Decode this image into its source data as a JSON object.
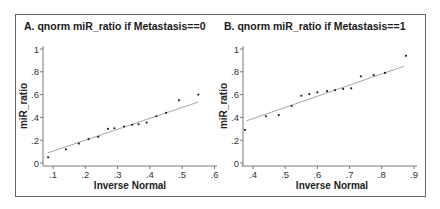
{
  "chart_data": [
    {
      "type": "scatter",
      "title": "A. qnorm miR_ratio if Metastasis==0",
      "xlabel": "Inverse Normal",
      "ylabel": "miR_ratio",
      "xlim": [
        0.08,
        0.6
      ],
      "ylim": [
        0,
        1
      ],
      "xticks": [
        ".1",
        ".2",
        ".3",
        ".4",
        ".5",
        ".6"
      ],
      "yticks": [
        "0",
        ".2",
        ".4",
        ".6",
        ".8",
        "1"
      ],
      "grid": false,
      "legend": null,
      "series": [
        {
          "name": "miR_ratio quantiles",
          "x": [
            0.085,
            0.14,
            0.18,
            0.21,
            0.24,
            0.27,
            0.29,
            0.32,
            0.345,
            0.365,
            0.39,
            0.42,
            0.45,
            0.49,
            0.55
          ],
          "y": [
            0.05,
            0.12,
            0.17,
            0.21,
            0.23,
            0.3,
            0.305,
            0.32,
            0.335,
            0.34,
            0.355,
            0.41,
            0.44,
            0.55,
            0.6
          ]
        }
      ],
      "reference_line": {
        "x": [
          0.085,
          0.55
        ],
        "y": [
          0.09,
          0.535
        ]
      }
    },
    {
      "type": "scatter",
      "title": "B. qnorm miR_ratio if Metastasis==1",
      "xlabel": "Inverse Normal",
      "ylabel": "miR_ratio",
      "xlim": [
        0.37,
        0.9
      ],
      "ylim": [
        0,
        1
      ],
      "xticks": [
        ".4",
        ".5",
        ".6",
        ".7",
        ".8",
        ".9"
      ],
      "yticks": [
        "0",
        ".2",
        ".4",
        ".6",
        ".8",
        "1"
      ],
      "grid": false,
      "legend": null,
      "series": [
        {
          "name": "miR_ratio quantiles",
          "x": [
            0.375,
            0.44,
            0.48,
            0.52,
            0.55,
            0.575,
            0.6,
            0.63,
            0.655,
            0.68,
            0.705,
            0.735,
            0.775,
            0.81,
            0.875
          ],
          "y": [
            0.29,
            0.41,
            0.42,
            0.5,
            0.59,
            0.605,
            0.62,
            0.63,
            0.64,
            0.65,
            0.655,
            0.76,
            0.77,
            0.79,
            0.94
          ]
        }
      ],
      "reference_line": {
        "x": [
          0.38,
          0.87
        ],
        "y": [
          0.37,
          0.85
        ]
      }
    }
  ],
  "colors": {
    "points": "#222222",
    "fit_line": "#9a9a9a",
    "axis": "#555555",
    "frame": "#666666"
  }
}
